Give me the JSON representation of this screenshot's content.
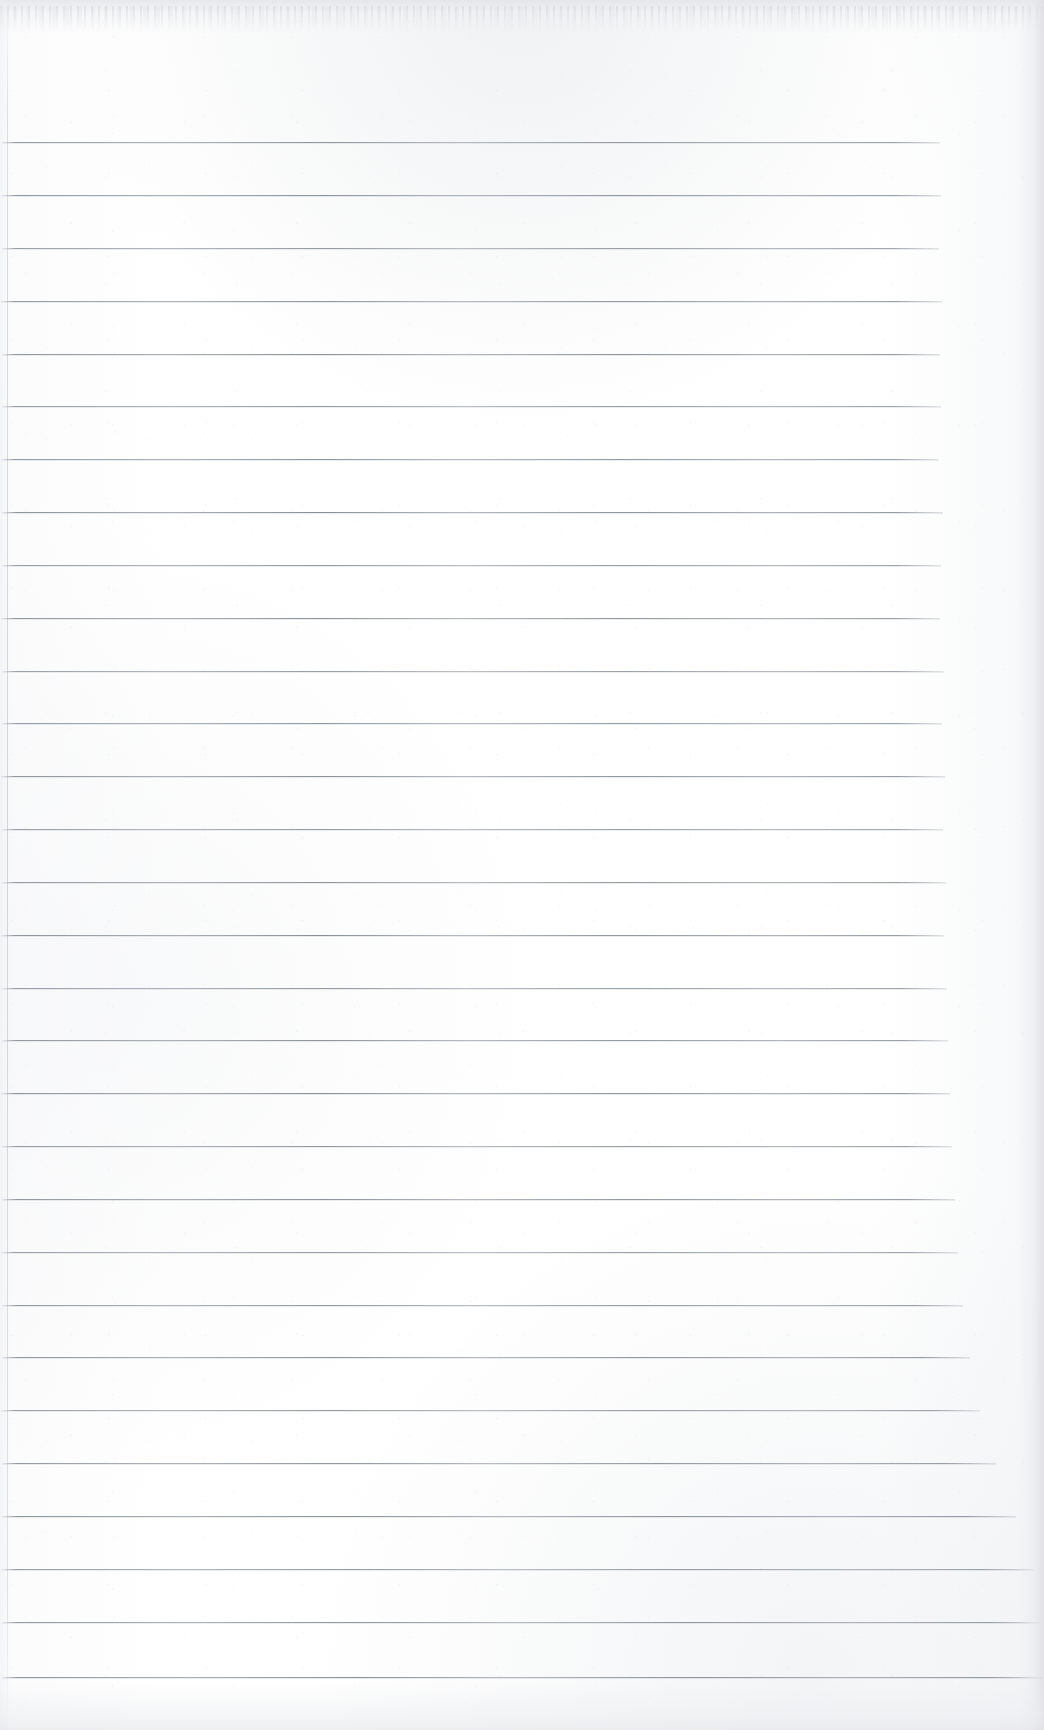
{
  "document": {
    "kind": "scanned-ruled-notebook-page",
    "title": "Blank Ruled Notebook Page",
    "orientation": "portrait",
    "width_px": 1044,
    "height_px": 1730,
    "has_text_content": false,
    "text_content": "",
    "paper_color": "#fdfdfd",
    "rule_color": "#7d838c",
    "margin_rule_color": "#b6bbc2"
  },
  "ruling": {
    "style": "wide-ruled horizontal lines",
    "line_count": 30,
    "first_line_y": 142,
    "line_spacing_px": 52.9,
    "line_thickness_px": 1,
    "left_start_x": 2,
    "lines": [
      {
        "index": 1,
        "y": 142,
        "x_start": 2,
        "x_end": 940
      },
      {
        "index": 2,
        "y": 195,
        "x_start": 2,
        "x_end": 941
      },
      {
        "index": 3,
        "y": 248,
        "x_start": 2,
        "x_end": 939
      },
      {
        "index": 4,
        "y": 301,
        "x_start": 1,
        "x_end": 942
      },
      {
        "index": 5,
        "y": 354,
        "x_start": 2,
        "x_end": 940
      },
      {
        "index": 6,
        "y": 406,
        "x_start": 2,
        "x_end": 941
      },
      {
        "index": 7,
        "y": 459,
        "x_start": 1,
        "x_end": 939
      },
      {
        "index": 8,
        "y": 512,
        "x_start": 2,
        "x_end": 943
      },
      {
        "index": 9,
        "y": 565,
        "x_start": 2,
        "x_end": 941
      },
      {
        "index": 10,
        "y": 618,
        "x_start": 1,
        "x_end": 940
      },
      {
        "index": 11,
        "y": 671,
        "x_start": 2,
        "x_end": 944
      },
      {
        "index": 12,
        "y": 723,
        "x_start": 2,
        "x_end": 942
      },
      {
        "index": 13,
        "y": 776,
        "x_start": 1,
        "x_end": 945
      },
      {
        "index": 14,
        "y": 829,
        "x_start": 2,
        "x_end": 943
      },
      {
        "index": 15,
        "y": 882,
        "x_start": 2,
        "x_end": 946
      },
      {
        "index": 16,
        "y": 935,
        "x_start": 1,
        "x_end": 944
      },
      {
        "index": 17,
        "y": 988,
        "x_start": 2,
        "x_end": 947
      },
      {
        "index": 18,
        "y": 1040,
        "x_start": 2,
        "x_end": 948
      },
      {
        "index": 19,
        "y": 1093,
        "x_start": 1,
        "x_end": 950
      },
      {
        "index": 20,
        "y": 1146,
        "x_start": 2,
        "x_end": 952
      },
      {
        "index": 21,
        "y": 1199,
        "x_start": 2,
        "x_end": 955
      },
      {
        "index": 22,
        "y": 1252,
        "x_start": 1,
        "x_end": 958
      },
      {
        "index": 23,
        "y": 1305,
        "x_start": 2,
        "x_end": 963
      },
      {
        "index": 24,
        "y": 1357,
        "x_start": 2,
        "x_end": 970
      },
      {
        "index": 25,
        "y": 1410,
        "x_start": 1,
        "x_end": 980
      },
      {
        "index": 26,
        "y": 1463,
        "x_start": 2,
        "x_end": 996
      },
      {
        "index": 27,
        "y": 1516,
        "x_start": 2,
        "x_end": 1016
      },
      {
        "index": 28,
        "y": 1569,
        "x_start": 1,
        "x_end": 1034
      },
      {
        "index": 29,
        "y": 1622,
        "x_start": 2,
        "x_end": 1040
      },
      {
        "index": 30,
        "y": 1677,
        "x_start": 2,
        "x_end": 1042
      }
    ]
  },
  "margin_rule": {
    "present": true,
    "orientation": "vertical",
    "x": 7,
    "top": 0,
    "bottom": 1730
  },
  "edges": {
    "top_tear": {
      "present": true,
      "height_px": 34,
      "description": "perforated torn strip"
    },
    "right_shadow": {
      "present": true,
      "width_px": 26
    },
    "bottom_shadow": {
      "present": true,
      "height_px": 46
    },
    "left_shadow": {
      "present": true,
      "width_px": 10
    }
  }
}
